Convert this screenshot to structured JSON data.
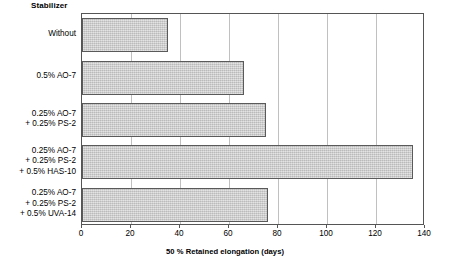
{
  "chart_data": {
    "type": "bar",
    "orientation": "horizontal",
    "title": "",
    "category_header": "Stabilizer",
    "categories": [
      "Without",
      "0.5% AO-7",
      "0.25% AO-7\n+ 0.25% PS-2",
      "0.25% AO-7\n+ 0.25% PS-2\n+ 0.5% HAS-10",
      "0.25% AO-7\n+ 0.25% PS-2\n+ 0.5% UVA-14"
    ],
    "values": [
      35,
      66,
      75,
      135,
      76
    ],
    "xlabel": "50 % Retained elongation (days)",
    "ylabel": "Stabilizer",
    "xlim": [
      0,
      140
    ],
    "xticks": [
      0,
      20,
      40,
      60,
      80,
      100,
      120,
      140
    ],
    "xtick_labels": [
      "0",
      "20",
      "40",
      "60",
      "80",
      "100",
      "120",
      "140"
    ],
    "grid": "vertical",
    "legend": "none",
    "bar_fill_color": "#c9c9c9",
    "bar_border_color": "#5a5a5a",
    "gridline_color": "#c0c0c0",
    "axis_color": "#555555",
    "background_color": "#ffffff"
  }
}
